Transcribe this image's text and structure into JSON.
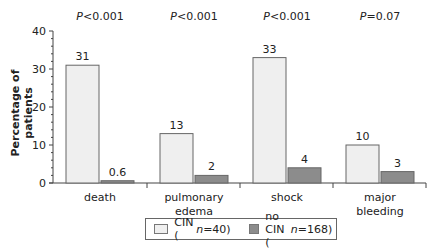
{
  "chart_data": {
    "type": "bar",
    "title": "",
    "xlabel": "",
    "ylabel": "Percentage of patients",
    "ylim": [
      0,
      40
    ],
    "yticks": [
      0,
      10,
      20,
      30,
      40
    ],
    "grid": false,
    "legend_position": "bottom",
    "categories": [
      "death",
      "pulmonary edema",
      "shock",
      "major bleeding"
    ],
    "series": [
      {
        "name": "CIN (n=40)",
        "values": [
          31,
          13,
          33,
          10
        ],
        "color": "#efefef"
      },
      {
        "name": "no CIN (n=168)",
        "values": [
          0.6,
          2,
          4,
          3
        ],
        "color": "#8c8c8c"
      }
    ],
    "data_labels": [
      [
        "31",
        "13",
        "33",
        "10"
      ],
      [
        "0.6",
        "2",
        "4",
        "3"
      ]
    ],
    "annotations": [
      "P<0.001",
      "P<0.001",
      "P<0.001",
      "P=0.07"
    ]
  },
  "pvalues": [
    {
      "sym": "P",
      "rest": "<0.001"
    },
    {
      "sym": "P",
      "rest": "<0.001"
    },
    {
      "sym": "P",
      "rest": "<0.001"
    },
    {
      "sym": "P",
      "rest": "=0.07"
    }
  ],
  "axis": {
    "ylabel": "Percentage of patients"
  },
  "legend": {
    "cin": {
      "label": "CIN (",
      "n": "n",
      "rest": "=40)"
    },
    "nocin": {
      "label": "no CIN (",
      "n": "n",
      "rest": "=168)"
    }
  }
}
